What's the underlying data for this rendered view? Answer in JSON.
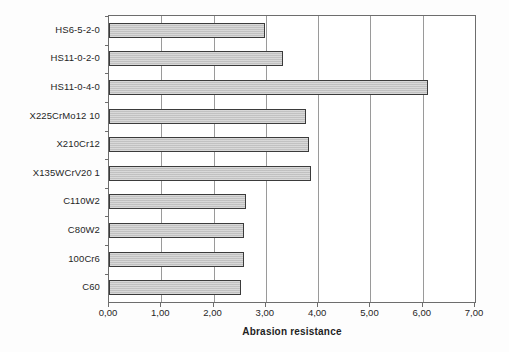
{
  "chart_data": {
    "type": "bar",
    "orientation": "horizontal",
    "title": "",
    "xlabel": "Abrasion resistance",
    "ylabel": "",
    "xlim": [
      0,
      7
    ],
    "grid": true,
    "legend": false,
    "decimal_separator": ",",
    "xticks": [
      "0,00",
      "1,00",
      "2,00",
      "3,00",
      "4,00",
      "5,00",
      "6,00",
      "7,00"
    ],
    "xtick_values": [
      0,
      1,
      2,
      3,
      4,
      5,
      6,
      7
    ],
    "categories": [
      "HS6-5-2-0",
      "HS11-0-2-0",
      "HS11-0-4-0",
      "X225CrMo12 10",
      "X210Cr12",
      "X135WCrV20 1",
      "C110W2",
      "C80W2",
      "100Cr6",
      "C60"
    ],
    "values": [
      2.98,
      3.33,
      6.1,
      3.77,
      3.83,
      3.86,
      2.62,
      2.58,
      2.58,
      2.52
    ],
    "bar_color": "#c8c8c8",
    "bar_edge_color": "#3b3b3b",
    "grid_color": "#9a9a9a",
    "axis_color": "#6d6d6d",
    "background": "#ffffff"
  }
}
